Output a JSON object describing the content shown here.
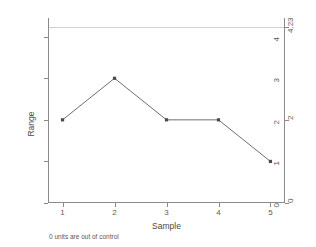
{
  "chart_data": {
    "type": "line",
    "title": "",
    "subtitle": "",
    "xlabel": "Sample",
    "ylabel": "Range",
    "x": [
      1,
      2,
      3,
      4,
      5
    ],
    "values": [
      2,
      3,
      2,
      2,
      1
    ],
    "series": [
      {
        "name": "Range",
        "values": [
          2,
          3,
          2,
          2,
          1
        ]
      }
    ],
    "categories": [
      "1",
      "2",
      "3",
      "4",
      "5"
    ],
    "xlim": [
      0.72,
      5.28
    ],
    "ylim": [
      0,
      4.45
    ],
    "xticks": [
      1,
      2,
      3,
      4,
      5
    ],
    "xtick_labels": [
      "1",
      "2",
      "3",
      "4",
      "5"
    ],
    "yticks": [
      0,
      1,
      2,
      3,
      4
    ],
    "ytick_labels": [
      "0",
      "1",
      "2",
      "3",
      "4"
    ],
    "right_axis": {
      "ticks": [
        0,
        2,
        4.23
      ],
      "tick_labels": [
        "0",
        "2",
        "4.23"
      ]
    },
    "control_limits": {
      "upper_control_limit": 4.23,
      "upper_control_limit_label": "4.23",
      "center_line": 2,
      "center_line_label": "2",
      "lower_control_limit": 0,
      "lower_control_limit_label": "0"
    },
    "annotation": "0 units are out of control",
    "grid": false,
    "legend": false,
    "marker": "square",
    "line_color": "#6e6e6e",
    "marker_color": "#4a4a4a",
    "limit_line_color": "#d0d0d0",
    "axis_color": "#8a8a8a"
  },
  "axes": {
    "y_title": "Range",
    "x_title": "Sample"
  },
  "footer": {
    "note": "0 units are out of control"
  }
}
